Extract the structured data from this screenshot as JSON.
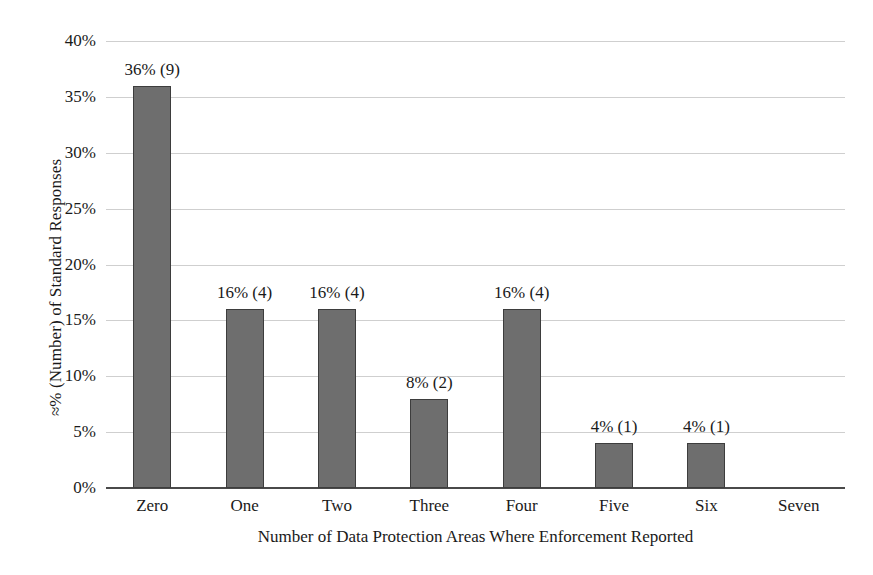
{
  "chart_data": {
    "type": "bar",
    "title": "",
    "subtitle": "",
    "xlabel": "Number of Data Protection Areas Where Enforcement Reported",
    "ylabel": "≈% (Number) of Standard Responses",
    "categories": [
      "Zero",
      "One",
      "Two",
      "Three",
      "Four",
      "Five",
      "Six",
      "Seven"
    ],
    "values": [
      36,
      16,
      16,
      8,
      16,
      4,
      4,
      0
    ],
    "counts": [
      9,
      4,
      4,
      2,
      4,
      1,
      1,
      0
    ],
    "data_labels": [
      "36% (9)",
      "16% (4)",
      "16% (4)",
      "8% (2)",
      "16% (4)",
      "4% (1)",
      "4% (1)",
      ""
    ],
    "ylim": [
      0,
      40
    ],
    "ytick_values": [
      0,
      5,
      10,
      15,
      20,
      25,
      30,
      35,
      40
    ],
    "ytick_labels": [
      "0%",
      "5%",
      "10%",
      "15%",
      "20%",
      "25%",
      "30%",
      "35%",
      "40%"
    ],
    "grid": true,
    "legend": false,
    "legend_position": "none",
    "colors": {
      "bar_fill": "#6e6e6e",
      "bar_border": "#3d3d3d",
      "gridline": "#cfcfcf",
      "axis": "#4a4a4a",
      "background": "#ffffff",
      "text": "#1a1a1a"
    }
  }
}
